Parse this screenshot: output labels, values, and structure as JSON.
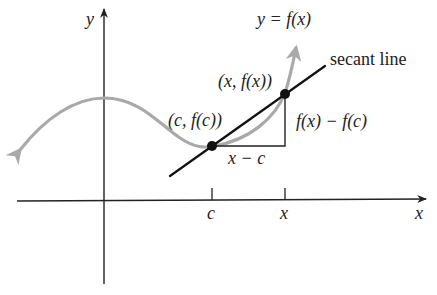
{
  "figure": {
    "curve_label": "y = f(x)",
    "secant_label": "secant line",
    "point_c_label": "(c, f(c))",
    "point_x_label": "(x, f(x))",
    "rise_label": "f(x) − f(c)",
    "run_label": "x − c",
    "y_axis_label": "y",
    "x_axis_label": "x",
    "tick_c_label": "c",
    "tick_x_label": "x",
    "colors": {
      "curve": "#a9a9a9",
      "axes": "#222222",
      "secant": "#111111",
      "points": "#111111"
    }
  }
}
